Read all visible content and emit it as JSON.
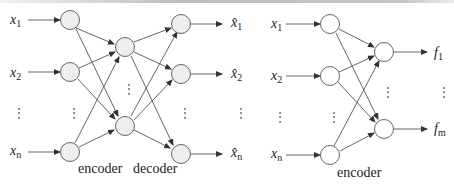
{
  "figure": {
    "left_network": {
      "name": "autoencoder",
      "inputs": [
        {
          "var": "x",
          "sub": "1"
        },
        {
          "var": "x",
          "sub": "2"
        },
        {
          "var": "x",
          "sub": "n"
        }
      ],
      "outputs": [
        {
          "var": "x̂",
          "sub": "1"
        },
        {
          "var": "x̂",
          "sub": "2"
        },
        {
          "var": "x̂",
          "sub": "n"
        }
      ],
      "captions": {
        "encoder": "encoder",
        "decoder": "decoder"
      },
      "node_fill": "#eeeeee"
    },
    "right_network": {
      "name": "encoder-only",
      "inputs": [
        {
          "var": "x",
          "sub": "1"
        },
        {
          "var": "x",
          "sub": "2"
        },
        {
          "var": "x",
          "sub": "n"
        }
      ],
      "outputs": [
        {
          "var": "f",
          "sub": "1"
        },
        {
          "var": "f",
          "sub": "m"
        }
      ],
      "captions": {
        "encoder": "encoder"
      },
      "node_fill": "#ffffff"
    },
    "ellipsis": "⋮",
    "stroke_color": "#444444"
  }
}
